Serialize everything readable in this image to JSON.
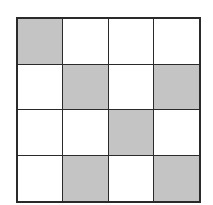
{
  "grid": {
    "rows": 4,
    "cols": 4,
    "shaded_color": "#c4c4c4",
    "unshaded_color": "#ffffff",
    "line_color": "#2a2a2a",
    "cells": [
      [
        1,
        0,
        0,
        0
      ],
      [
        0,
        1,
        0,
        1
      ],
      [
        0,
        0,
        1,
        0
      ],
      [
        0,
        1,
        0,
        1
      ]
    ]
  }
}
